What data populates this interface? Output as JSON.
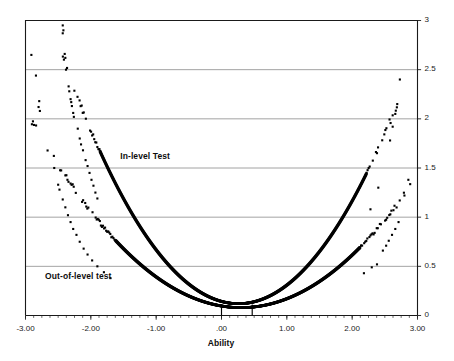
{
  "chart_data": {
    "type": "scatter",
    "title": "",
    "xlabel": "Ability",
    "ylabel": "",
    "xlim": [
      -3,
      3
    ],
    "ylim": [
      0,
      3
    ],
    "grid": true,
    "grid_axis": "y",
    "legend_position": "inline-annotation",
    "xticks": [
      "-3.00",
      "-2.00",
      "-1.00",
      ".00",
      "1.00",
      "2.00",
      "3.00"
    ],
    "xtick_values": [
      -3,
      -2,
      -1,
      0,
      1,
      2,
      3
    ],
    "yticks": [
      "0",
      "0.5",
      "1",
      "1.5",
      "2",
      "2.5",
      "3"
    ],
    "ytick_values": [
      0,
      0.5,
      1,
      1.5,
      2,
      2.5,
      3
    ],
    "minor_xticks": true,
    "markers": [
      {
        "name": "marker-line-a",
        "x": 0.0
      },
      {
        "name": "marker-line-b",
        "x": 0.47
      }
    ],
    "series": [
      {
        "name": "In-level Test",
        "label": "In-level Test",
        "label_x": -1.55,
        "label_y": 1.62,
        "color": "#000000",
        "marker": "square",
        "marker_size": 2.1,
        "curve": {
          "vertex_x": 0.26,
          "min_y": 0.12,
          "a": 0.345
        },
        "x_dense": [
          -1.86,
          2.22
        ],
        "x_full": [
          -2.46,
          2.78
        ],
        "scatter_jitter": 0.055,
        "points": [
          {
            "x": -2.43,
            "y": 2.95
          },
          {
            "x": -2.42,
            "y": 2.9
          },
          {
            "x": -2.43,
            "y": 2.87
          },
          {
            "x": -2.4,
            "y": 2.66
          },
          {
            "x": -2.39,
            "y": 2.62
          },
          {
            "x": -2.38,
            "y": 2.5
          },
          {
            "x": -2.34,
            "y": 2.33
          },
          {
            "x": -2.33,
            "y": 2.28
          },
          {
            "x": -2.31,
            "y": 2.2
          },
          {
            "x": -2.3,
            "y": 2.17
          },
          {
            "x": -2.29,
            "y": 2.13
          },
          {
            "x": -2.27,
            "y": 2.06
          },
          {
            "x": -2.26,
            "y": 2.02
          },
          {
            "x": -2.2,
            "y": 1.9
          },
          {
            "x": -2.17,
            "y": 1.8
          },
          {
            "x": -2.15,
            "y": 1.74
          },
          {
            "x": -2.12,
            "y": 1.68
          },
          {
            "x": -2.08,
            "y": 1.58
          },
          {
            "x": -2.05,
            "y": 1.52
          },
          {
            "x": -2.02,
            "y": 1.45
          },
          {
            "x": -1.99,
            "y": 1.38
          },
          {
            "x": -1.96,
            "y": 1.32
          },
          {
            "x": -1.93,
            "y": 1.25
          },
          {
            "x": -1.9,
            "y": 1.19
          },
          {
            "x": 2.28,
            "y": 1.08
          },
          {
            "x": 2.4,
            "y": 1.3
          },
          {
            "x": 2.58,
            "y": 1.78
          },
          {
            "x": 2.62,
            "y": 1.92
          },
          {
            "x": 2.66,
            "y": 2.05
          },
          {
            "x": 2.69,
            "y": 2.15
          },
          {
            "x": 2.73,
            "y": 2.4
          }
        ]
      },
      {
        "name": "Out-of-level test",
        "label": "Out-of-level test",
        "label_x": -2.7,
        "label_y": 0.4,
        "color": "#000000",
        "marker": "square",
        "marker_size": 2.1,
        "curve": {
          "vertex_x": 0.3,
          "min_y": 0.08,
          "a": 0.185
        },
        "x_dense": [
          -1.62,
          2.12
        ],
        "x_full": [
          -2.95,
          2.95
        ],
        "scatter_jitter": 0.05,
        "points": [
          {
            "x": -2.91,
            "y": 2.65
          },
          {
            "x": -2.84,
            "y": 2.44
          },
          {
            "x": -2.79,
            "y": 2.18
          },
          {
            "x": -2.8,
            "y": 2.12
          },
          {
            "x": -2.78,
            "y": 2.08
          },
          {
            "x": -2.56,
            "y": 1.5
          },
          {
            "x": -2.5,
            "y": 1.33
          },
          {
            "x": -2.48,
            "y": 1.28
          },
          {
            "x": -2.43,
            "y": 1.18
          },
          {
            "x": -2.39,
            "y": 1.1
          },
          {
            "x": -2.35,
            "y": 1.02
          },
          {
            "x": -2.31,
            "y": 0.95
          },
          {
            "x": -2.27,
            "y": 0.88
          },
          {
            "x": -2.22,
            "y": 0.82
          },
          {
            "x": -2.17,
            "y": 0.75
          },
          {
            "x": -2.11,
            "y": 0.68
          },
          {
            "x": -2.05,
            "y": 0.62
          },
          {
            "x": -1.98,
            "y": 0.56
          },
          {
            "x": -1.9,
            "y": 0.5
          },
          {
            "x": -1.8,
            "y": 0.44
          },
          {
            "x": -1.7,
            "y": 0.38
          },
          {
            "x": 2.18,
            "y": 0.43
          },
          {
            "x": 2.3,
            "y": 0.49
          },
          {
            "x": 2.38,
            "y": 0.52
          },
          {
            "x": 2.47,
            "y": 0.66
          },
          {
            "x": 2.52,
            "y": 0.71
          },
          {
            "x": 2.56,
            "y": 0.76
          },
          {
            "x": 2.61,
            "y": 0.82
          },
          {
            "x": 2.66,
            "y": 0.88
          },
          {
            "x": 2.71,
            "y": 0.95
          },
          {
            "x": 2.8,
            "y": 1.22
          },
          {
            "x": 2.86,
            "y": 1.38
          }
        ]
      }
    ]
  },
  "axes": {
    "x_title": "Ability",
    "x_labels": [
      "-3.00",
      "-2.00",
      "-1.00",
      ".00",
      "1.00",
      "2.00",
      "3.00"
    ],
    "y_labels": [
      "3",
      "2.5",
      "2",
      "1.5",
      "1",
      "0.5",
      "0"
    ]
  },
  "annotations": {
    "in_level": "In-level Test",
    "out_of_level": "Out-of-level test"
  },
  "colors": {
    "plot_line": "#000000",
    "gridline": "#8c8c8c",
    "axis": "#1a1a1a",
    "background": "#ffffff",
    "text": "#0d0d0d"
  }
}
